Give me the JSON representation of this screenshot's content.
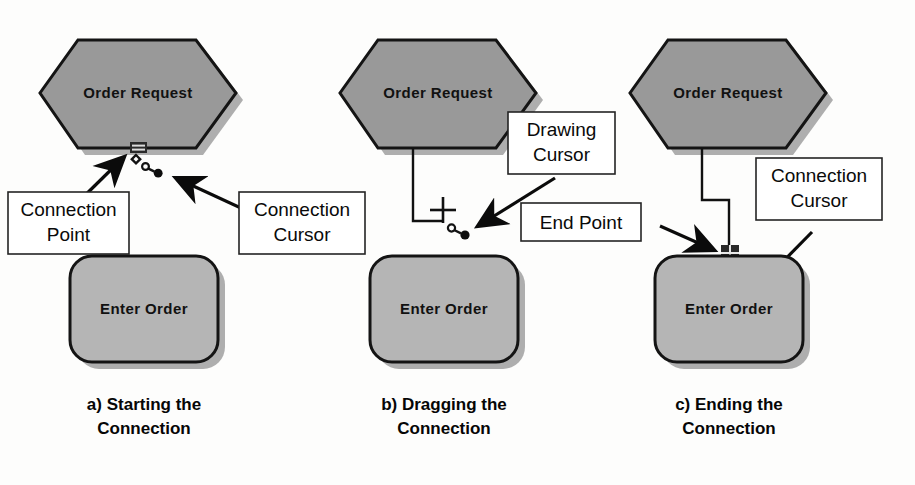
{
  "figure": {
    "background_color": "#fdfdfc",
    "shape_fill_hexagon": "#999999",
    "shape_fill_rounded": "#b5b5b5",
    "shape_stroke": "#141414",
    "shadow_color": "#aaaaaa",
    "callout_fill": "#ffffff",
    "callout_stroke": "#222222"
  },
  "panels": [
    {
      "id": "a",
      "caption_line1": "a) Starting the",
      "caption_line2": "Connection",
      "hexagon_label": "Order Request",
      "rounded_label": "Enter Order",
      "callouts": [
        {
          "line1": "Connection",
          "line2": "Point"
        },
        {
          "line1": "Connection",
          "line2": "Cursor"
        }
      ]
    },
    {
      "id": "b",
      "caption_line1": "b) Dragging the",
      "caption_line2": "Connection",
      "hexagon_label": "Order Request",
      "rounded_label": "Enter Order",
      "callouts": [
        {
          "line1": "Drawing",
          "line2": "Cursor"
        }
      ]
    },
    {
      "id": "c",
      "caption_line1": "c) Ending the",
      "caption_line2": "Connection",
      "hexagon_label": "Order Request",
      "rounded_label": "Enter Order",
      "callouts": [
        {
          "line1": "End Point",
          "line2": ""
        },
        {
          "line1": "Connection",
          "line2": "Cursor"
        }
      ]
    }
  ],
  "icons": {
    "connection_cursor": "connection-cursor-icon",
    "drawing_cursor": "crosshair-cursor-icon",
    "connection_point_handle": "connection-point-handle-icon",
    "end_point_handle": "end-point-handle-icon"
  }
}
